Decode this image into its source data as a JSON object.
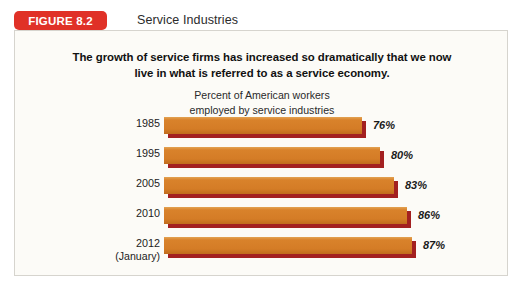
{
  "header": {
    "badge_label": "FIGURE 8.2",
    "title": "Service Industries",
    "badge_color": "#E03127"
  },
  "caption": {
    "line1": "The growth of service firms has increased so dramatically that we now",
    "line2": "live in what is referred to as a service economy."
  },
  "axis_note": {
    "line1": "Percent of American workers",
    "line2": "employed by service industries"
  },
  "chart_data": {
    "type": "bar",
    "orientation": "horizontal",
    "title": "Service Industries",
    "subtitle": "The growth of service firms has increased so dramatically that we now live in what is referred to as a service economy.",
    "xlabel": "Percent of American workers employed by service industries",
    "ylabel": "",
    "grid": false,
    "legend": false,
    "xlim": [
      0,
      100
    ],
    "categories": [
      "1985",
      "1995",
      "2005",
      "2010",
      "2012"
    ],
    "category_sublabels": [
      "",
      "",
      "",
      "",
      "(January)"
    ],
    "values": [
      76,
      80,
      83,
      86,
      87
    ],
    "value_labels": [
      "76%",
      "80%",
      "83%",
      "86%",
      "87%"
    ],
    "bar_face_color": "#D9822B",
    "bar_shadow_color": "#A32020",
    "bars": [
      {
        "category": "1985",
        "sublabel": "",
        "value": 76,
        "label": "76%",
        "pixel_width": 198
      },
      {
        "category": "1995",
        "sublabel": "",
        "value": 80,
        "label": "80%",
        "pixel_width": 216
      },
      {
        "category": "2005",
        "sublabel": "",
        "value": 83,
        "label": "83%",
        "pixel_width": 230
      },
      {
        "category": "2010",
        "sublabel": "",
        "value": 86,
        "label": "86%",
        "pixel_width": 243
      },
      {
        "category": "2012",
        "sublabel": "(January)",
        "value": 87,
        "label": "87%",
        "pixel_width": 248
      }
    ]
  }
}
